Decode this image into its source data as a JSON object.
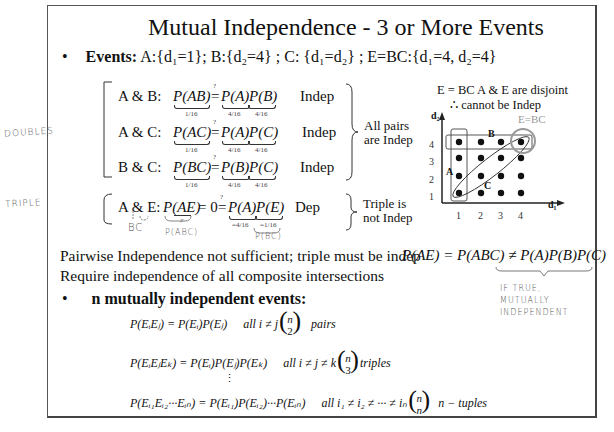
{
  "slide": {
    "title": "Mutual Independence - 3 or More Events",
    "events_line": {
      "bullet": "•",
      "label": "Events:",
      "text": " A:{d₁=1}; B:{d₂=4} ; C: {d₁=d₂} ; E=BC:{d₁=4, d₂=4}"
    },
    "pairs": [
      {
        "label": "A & B:",
        "lhs": "P(AB)",
        "eq": "=",
        "q": "?",
        "rhs_a": "P(A)",
        "rhs_b": "P(B)",
        "lhs_val": "1/16",
        "val_a": "4/16",
        "val_b": "4/16",
        "result": "Indep"
      },
      {
        "label": "A & C:",
        "lhs": "P(AC)",
        "eq": "=",
        "q": "?",
        "rhs_a": "P(A)",
        "rhs_b": "P(C)",
        "lhs_val": "1/16",
        "val_a": "4/16",
        "val_b": "4/16",
        "result": "Indep"
      },
      {
        "label": "B & C:",
        "lhs": "P(BC)",
        "eq": "=",
        "q": "?",
        "rhs_a": "P(B)",
        "rhs_b": "P(C)",
        "lhs_val": "1/16",
        "val_a": "4/16",
        "val_b": "4/16",
        "result": "Indep"
      }
    ],
    "pairs_conclusion": [
      "All pairs",
      "are Indep"
    ],
    "triple": {
      "label": "A & E:",
      "lhs": "P(AE)",
      "middle": "= 0",
      "eq": "=",
      "q": "?",
      "rhs_a": "P(A)",
      "rhs_b": "P(E)",
      "val_a": "=4/16",
      "val_b": "=1/16",
      "lhs_note": "≠",
      "result": "Dep"
    },
    "triple_conclusion": [
      "Triple is",
      "not Indep"
    ],
    "disjoint_note": [
      "E = BC   A & E are disjoint",
      "∴ cannot  be Indep"
    ],
    "diagram": {
      "x_axis_label": "d₁",
      "y_axis_label": "d₂",
      "x_ticks": [
        "1",
        "2",
        "3",
        "4"
      ],
      "y_ticks": [
        "4",
        "3",
        "2",
        "1"
      ],
      "region_labels": {
        "A": "A",
        "B": "B",
        "C": "C",
        "E": "E=BC"
      }
    },
    "pairwise_text": "Pairwise Independence not sufficient; triple must  be indep",
    "composite_text": "Require independence of all composite intersections",
    "pae_formula": "P(AE) = P(ABC) ≠ P(A)P(B)P(C)",
    "n_events": {
      "bullet": "•",
      "label": "n mutually independent events:",
      "formulas": [
        {
          "lhs": "P(EᵢEⱼ) = P(Eᵢ)P(Eⱼ)",
          "cond": "all  i ≠ j",
          "binom_top": "n",
          "binom_bottom": "2",
          "suffix": "pairs"
        },
        {
          "lhs": "P(EᵢEⱼEₖ) = P(Eᵢ)P(Eⱼ)P(Eₖ)",
          "cond": "all  i ≠ j ≠ k",
          "binom_top": "n",
          "binom_bottom": "3",
          "suffix": "triples"
        },
        {
          "lhs": "P(Eᵢ₁Eᵢ₂···Eᵢₙ) = P(Eᵢ₁)P(Eᵢ₂)···P(Eᵢₙ)",
          "cond": "all  i₁ ≠ i₂ ≠ ··· ≠ iₙ",
          "binom_top": "n",
          "binom_bottom": "n",
          "suffix": "n − tuples"
        }
      ],
      "vdots": "⋮"
    }
  },
  "annotations": {
    "doubles": "DOUBLES",
    "triple": "TRIPLE",
    "bc": "BC",
    "pabc": "P(ABC)",
    "pbc": "P(BC)",
    "if_true": [
      "IF TRUE,",
      "MUTUALLY",
      "INDEPENDENT"
    ]
  }
}
